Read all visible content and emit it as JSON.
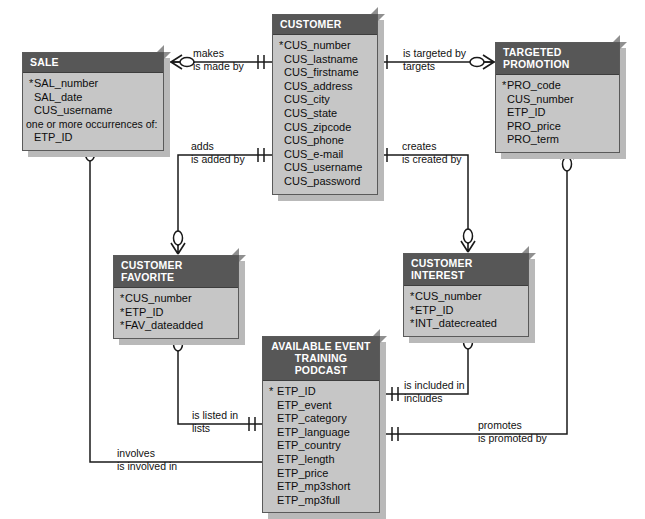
{
  "diagram": {
    "notation": "crows-foot",
    "colors": {
      "entity_header_bg": "#575757",
      "entity_header_text": "#ffffff",
      "entity_body_bg": "#c6c6c6",
      "entity_border": "#5a5a5a",
      "entity_3d_face": "#8f8f8f",
      "shadow": "#b9b9b9",
      "line": "#1a1a1a",
      "canvas_bg": "#ffffff"
    }
  },
  "entities": [
    {
      "id": "sale",
      "name": "SALE",
      "attributes": [
        {
          "text": "SAL_number",
          "key": true
        },
        {
          "text": "SAL_date",
          "key": false
        },
        {
          "text": "CUS_username",
          "key": false
        },
        {
          "text": "one or more occurrences of:",
          "key": false,
          "note": true
        },
        {
          "text": "ETP_ID",
          "key": false
        }
      ]
    },
    {
      "id": "customer",
      "name": "CUSTOMER",
      "attributes": [
        {
          "text": "CUS_number",
          "key": true
        },
        {
          "text": "CUS_lastname",
          "key": false
        },
        {
          "text": "CUS_firstname",
          "key": false
        },
        {
          "text": "CUS_address",
          "key": false
        },
        {
          "text": "CUS_city",
          "key": false
        },
        {
          "text": "CUS_state",
          "key": false
        },
        {
          "text": "CUS_zipcode",
          "key": false
        },
        {
          "text": "CUS_phone",
          "key": false
        },
        {
          "text": "CUS_e-mail",
          "key": false
        },
        {
          "text": "CUS_username",
          "key": false
        },
        {
          "text": "CUS_password",
          "key": false
        }
      ]
    },
    {
      "id": "targeted_promotion",
      "name": "TARGETED PROMOTION",
      "attributes": [
        {
          "text": "PRO_code",
          "key": true
        },
        {
          "text": "CUS_number",
          "key": false
        },
        {
          "text": "ETP_ID",
          "key": false
        },
        {
          "text": "PRO_price",
          "key": false
        },
        {
          "text": "PRO_term",
          "key": false
        }
      ]
    },
    {
      "id": "customer_favorite",
      "name": "CUSTOMER FAVORITE",
      "attributes": [
        {
          "text": "CUS_number",
          "key": true
        },
        {
          "text": "ETP_ID",
          "key": true
        },
        {
          "text": "FAV_dateadded",
          "key": true
        }
      ]
    },
    {
      "id": "customer_interest",
      "name": "CUSTOMER INTEREST",
      "attributes": [
        {
          "text": "CUS_number",
          "key": true
        },
        {
          "text": "ETP_ID",
          "key": true
        },
        {
          "text": "INT_datecreated",
          "key": true
        }
      ]
    },
    {
      "id": "available_event_training_podcast",
      "name_line1": "AVAILABLE EVENT",
      "name_line2": "TRAINING PODCAST",
      "name": "AVAILABLE EVENT TRAINING PODCAST",
      "attributes": [
        {
          "text": "ETP_ID",
          "key": true
        },
        {
          "text": "ETP_event",
          "key": false
        },
        {
          "text": "ETP_category",
          "key": false
        },
        {
          "text": "ETP_language",
          "key": false
        },
        {
          "text": "ETP_country",
          "key": false
        },
        {
          "text": "ETP_length",
          "key": false
        },
        {
          "text": "ETP_price",
          "key": false
        },
        {
          "text": "ETP_mp3short",
          "key": false
        },
        {
          "text": "ETP_mp3full",
          "key": false
        }
      ]
    }
  ],
  "relationships": [
    {
      "id": "customer-makes-sale",
      "from": "customer",
      "to": "sale",
      "verb_top": "makes",
      "verb_bottom": "is made by",
      "from_cardinality": "one-mandatory",
      "to_cardinality": "many-optional"
    },
    {
      "id": "customer-targeted-by-promotion",
      "from": "customer",
      "to": "targeted_promotion",
      "verb_top": "is targeted by",
      "verb_bottom": "targets",
      "from_cardinality": "one-mandatory",
      "to_cardinality": "many-optional"
    },
    {
      "id": "customer-adds-favorite",
      "from": "customer",
      "to": "customer_favorite",
      "verb_top": "adds",
      "verb_bottom": "is added by",
      "from_cardinality": "one-mandatory",
      "to_cardinality": "many-optional"
    },
    {
      "id": "customer-creates-interest",
      "from": "customer",
      "to": "customer_interest",
      "verb_top": "creates",
      "verb_bottom": "is created by",
      "from_cardinality": "one-mandatory",
      "to_cardinality": "many-optional"
    },
    {
      "id": "podcast-included-in-interest",
      "from": "available_event_training_podcast",
      "to": "customer_interest",
      "verb_top": "is included in",
      "verb_bottom": "includes",
      "from_cardinality": "one-mandatory",
      "to_cardinality": "many-optional"
    },
    {
      "id": "podcast-listed-in-favorite",
      "from": "available_event_training_podcast",
      "to": "customer_favorite",
      "verb_top": "is listed in",
      "verb_bottom": "lists",
      "from_cardinality": "one-mandatory",
      "to_cardinality": "many-optional"
    },
    {
      "id": "promotion-promotes-podcast",
      "from": "targeted_promotion",
      "to": "available_event_training_podcast",
      "verb_top": "promotes",
      "verb_bottom": "is promoted by",
      "from_cardinality": "many-optional",
      "to_cardinality": "one-mandatory"
    },
    {
      "id": "sale-involves-podcast",
      "from": "sale",
      "to": "available_event_training_podcast",
      "verb_top": "involves",
      "verb_bottom": "is involved in",
      "from_cardinality": "many-optional",
      "to_cardinality": "many-mandatory"
    }
  ],
  "labels": {
    "makes": "makes",
    "is_made_by": "is made by",
    "is_targeted_by": "is targeted by",
    "targets": "targets",
    "adds": "adds",
    "is_added_by": "is added by",
    "creates": "creates",
    "is_created_by": "is created by",
    "is_included_in": "is included in",
    "includes": "includes",
    "is_listed_in": "is listed in",
    "lists": "lists",
    "promotes": "promotes",
    "is_promoted_by": "is promoted by",
    "involves": "involves",
    "is_involved_in": "is involved in"
  }
}
